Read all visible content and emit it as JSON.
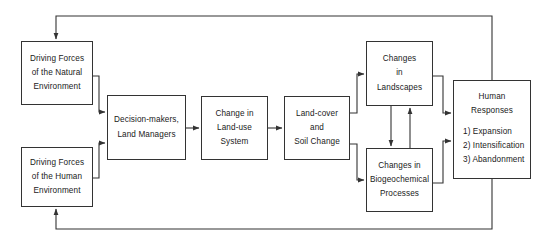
{
  "diagram": {
    "background_color": "#ffffff",
    "box_border_color": "#333333",
    "connector_color": "#333333",
    "nodes": [
      {
        "id": "driving-forces-natural",
        "name": "driving-forces-natural-box",
        "lines": [
          "Driving Forces",
          "of the Natural",
          "Environment"
        ],
        "x": 21,
        "y": 41,
        "w": 72,
        "h": 64
      },
      {
        "id": "driving-forces-human",
        "name": "driving-forces-human-box",
        "lines": [
          "Driving Forces",
          "of the Human",
          "Environment"
        ],
        "x": 21,
        "y": 147,
        "w": 72,
        "h": 60
      },
      {
        "id": "decision-makers",
        "name": "decision-makers-box",
        "lines": [
          "Decision-makers,",
          "Land Managers"
        ],
        "x": 107,
        "y": 95,
        "w": 79,
        "h": 65
      },
      {
        "id": "land-use-system",
        "name": "change-in-land-use-system-box",
        "lines": [
          "Change in",
          "Land-use",
          "System"
        ],
        "x": 201,
        "y": 96,
        "w": 67,
        "h": 64
      },
      {
        "id": "land-cover-soil",
        "name": "land-cover-and-soil-change-box",
        "lines": [
          "Land-cover",
          "and",
          "Soil Change"
        ],
        "x": 284,
        "y": 96,
        "w": 66,
        "h": 64
      },
      {
        "id": "changes-landscapes",
        "name": "changes-in-landscapes-box",
        "lines": [
          "Changes",
          "in",
          "Landscapes"
        ],
        "x": 366,
        "y": 41,
        "w": 67,
        "h": 65
      },
      {
        "id": "changes-biogeochemical",
        "name": "changes-in-biogeochemical-processes-box",
        "lines": [
          "Changes in",
          "Biogeochemical",
          "Processes"
        ],
        "x": 366,
        "y": 148,
        "w": 67,
        "h": 64
      },
      {
        "id": "human-responses",
        "name": "human-responses-box",
        "title_lines": [
          "Human",
          "Responses"
        ],
        "item_lines": [
          "1) Expansion",
          "2) Intensification",
          "3) Abandonment"
        ],
        "x": 453,
        "y": 80,
        "w": 78,
        "h": 99
      }
    ],
    "connectors": [
      {
        "name": "natural-to-decision-makers",
        "from": "driving-forces-natural",
        "to": "decision-makers",
        "arrow": true
      },
      {
        "name": "human-to-decision-makers",
        "from": "driving-forces-human",
        "to": "decision-makers",
        "arrow": true
      },
      {
        "name": "decision-makers-to-land-use-system",
        "from": "decision-makers",
        "to": "land-use-system",
        "arrow": true
      },
      {
        "name": "land-use-system-to-land-cover",
        "from": "land-use-system",
        "to": "land-cover-soil",
        "arrow": true
      },
      {
        "name": "land-cover-to-landscapes",
        "from": "land-cover-soil",
        "to": "changes-landscapes",
        "arrow": true
      },
      {
        "name": "land-cover-to-biogeochemical",
        "from": "land-cover-soil",
        "to": "changes-biogeochemical",
        "arrow": true
      },
      {
        "name": "landscapes-to-biogeochemical",
        "from": "changes-landscapes",
        "to": "changes-biogeochemical",
        "arrow": true
      },
      {
        "name": "biogeochemical-to-landscapes",
        "from": "changes-biogeochemical",
        "to": "changes-landscapes",
        "arrow": true
      },
      {
        "name": "landscapes-to-human-responses",
        "from": "changes-landscapes",
        "to": "human-responses",
        "arrow": true
      },
      {
        "name": "biogeochemical-to-human-responses",
        "from": "changes-biogeochemical",
        "to": "human-responses",
        "arrow": true
      },
      {
        "name": "human-responses-feedback-to-natural",
        "from": "human-responses",
        "to": "driving-forces-natural",
        "arrow": true
      },
      {
        "name": "human-responses-feedback-to-human",
        "from": "human-responses",
        "to": "driving-forces-human",
        "arrow": true
      }
    ]
  }
}
